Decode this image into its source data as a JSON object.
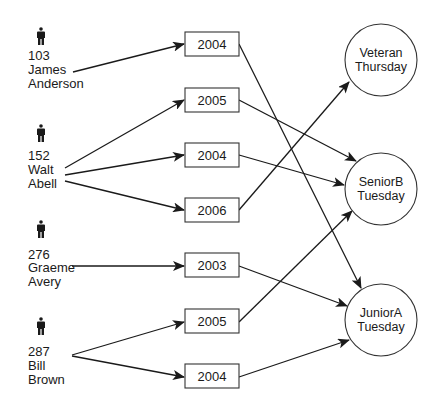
{
  "diagram": {
    "type": "membership-flow",
    "people": [
      {
        "id": "103",
        "first": "James",
        "last": "Anderson"
      },
      {
        "id": "152",
        "first": "Walt",
        "last": "Abell"
      },
      {
        "id": "276",
        "first": "Graeme",
        "last": "Avery"
      },
      {
        "id": "287",
        "first": "Bill",
        "last": "Brown"
      }
    ],
    "years": [
      {
        "label": "2004"
      },
      {
        "label": "2005"
      },
      {
        "label": "2004"
      },
      {
        "label": "2006"
      },
      {
        "label": "2003"
      },
      {
        "label": "2005"
      },
      {
        "label": "2004"
      }
    ],
    "teams": [
      {
        "line1": "Veteran",
        "line2": "Thursday"
      },
      {
        "line1": "SeniorB",
        "line2": "Tuesday"
      },
      {
        "line1": "JuniorA",
        "line2": "Tuesday"
      }
    ],
    "edges": [
      {
        "from": "person:103",
        "to": "year:0"
      },
      {
        "from": "person:152",
        "to": "year:1"
      },
      {
        "from": "person:152",
        "to": "year:2"
      },
      {
        "from": "person:152",
        "to": "year:3"
      },
      {
        "from": "person:276",
        "to": "year:4"
      },
      {
        "from": "person:287",
        "to": "year:5"
      },
      {
        "from": "person:287",
        "to": "year:6"
      },
      {
        "from": "year:0",
        "to": "team:JuniorA"
      },
      {
        "from": "year:1",
        "to": "team:SeniorB"
      },
      {
        "from": "year:2",
        "to": "team:SeniorB"
      },
      {
        "from": "year:3",
        "to": "team:Veteran"
      },
      {
        "from": "year:4",
        "to": "team:JuniorA"
      },
      {
        "from": "year:5",
        "to": "team:SeniorB"
      },
      {
        "from": "year:6",
        "to": "team:JuniorA"
      }
    ],
    "icon": "person-icon",
    "colors": {
      "stroke": "#1a1a1a",
      "background": "#ffffff"
    }
  }
}
